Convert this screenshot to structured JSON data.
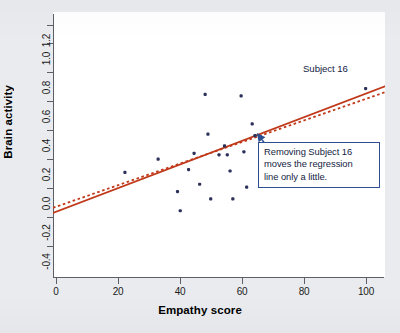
{
  "figure": {
    "background_color": "#e9ebef",
    "plot_background_color": "#ffffff",
    "axis_color": "#5c5f66",
    "point_color": "#2b3158",
    "line_color": "#c0391a",
    "annotation_color": "#2e4f8f"
  },
  "chart_data": {
    "type": "scatter",
    "title": "",
    "xlabel": "Empathy score",
    "ylabel": "Brain activity",
    "xlim": [
      -7,
      113
    ],
    "ylim": [
      -0.5,
      1.3
    ],
    "xticks": [
      0,
      20,
      40,
      60,
      80,
      100
    ],
    "xtick_labels": [
      "0",
      "20",
      "40",
      "60",
      "80",
      "100"
    ],
    "yticks": [
      -0.4,
      -0.2,
      0.0,
      0.2,
      0.4,
      0.6,
      0.8,
      1.0,
      1.2
    ],
    "ytick_labels": [
      "-0.4",
      "-0.2",
      "0.0",
      "0.2",
      "0.4",
      "0.6",
      "0.8",
      "1.0",
      "1.2"
    ],
    "grid": false,
    "legend": "none",
    "points": [
      {
        "label": "",
        "x": 19,
        "y": 0.21
      },
      {
        "label": "",
        "x": 31,
        "y": 0.3
      },
      {
        "label": "",
        "x": 38,
        "y": 0.08
      },
      {
        "label": "",
        "x": 39,
        "y": -0.05
      },
      {
        "label": "",
        "x": 42,
        "y": 0.23
      },
      {
        "label": "",
        "x": 44,
        "y": 0.34
      },
      {
        "label": "",
        "x": 46,
        "y": 0.13
      },
      {
        "label": "",
        "x": 48,
        "y": 0.74
      },
      {
        "label": "",
        "x": 49,
        "y": 0.47
      },
      {
        "label": "",
        "x": 50,
        "y": 0.03
      },
      {
        "label": "",
        "x": 53,
        "y": 0.33
      },
      {
        "label": "",
        "x": 55,
        "y": 0.39
      },
      {
        "label": "",
        "x": 56,
        "y": 0.33
      },
      {
        "label": "",
        "x": 57,
        "y": 0.22
      },
      {
        "label": "",
        "x": 58,
        "y": 0.03
      },
      {
        "label": "",
        "x": 61,
        "y": 0.73
      },
      {
        "label": "",
        "x": 62,
        "y": 0.35
      },
      {
        "label": "",
        "x": 63,
        "y": 0.11
      },
      {
        "label": "",
        "x": 65,
        "y": 0.54
      },
      {
        "label": "",
        "x": 66,
        "y": 0.46
      },
      {
        "label": "Subject 16",
        "x": 106,
        "y": 0.78
      }
    ],
    "lines": [
      {
        "name": "regression-with-subject-16",
        "style": "solid",
        "color": "#c0391a",
        "x": [
          -7,
          113
        ],
        "y": [
          -0.065,
          0.795
        ]
      },
      {
        "name": "regression-without-subject-16",
        "style": "dashed",
        "color": "#c0391a",
        "x": [
          -7,
          113
        ],
        "y": [
          -0.03,
          0.755
        ]
      }
    ],
    "annotations": [
      {
        "name": "subject-16-label",
        "text": "Subject 16",
        "x": 100,
        "y": 0.94
      },
      {
        "name": "regression-note",
        "text": "Removing Subject 16 moves the regression line only a little.",
        "lines": [
          "Removing Subject 16",
          "moves the regression",
          "line only a little."
        ],
        "arrow_from_x": 74,
        "arrow_from_y": 0.3,
        "arrow_to_x": 67,
        "arrow_to_y": 0.47
      }
    ]
  }
}
